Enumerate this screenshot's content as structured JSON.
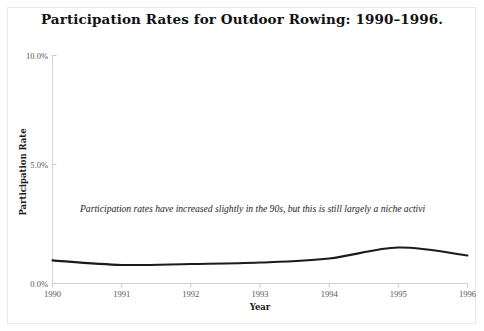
{
  "chart_data": {
    "type": "line",
    "title": "Participation Rates for Outdoor Rowing: 1990–1996.",
    "xlabel": "Year",
    "ylabel": "Participation Rate",
    "categories": [
      1990,
      1991,
      1992,
      1993,
      1994,
      1995,
      1996
    ],
    "x": [
      1990,
      1991,
      1992,
      1993,
      1994,
      1995,
      1996
    ],
    "values": [
      0.97,
      0.78,
      0.82,
      0.88,
      1.05,
      1.51,
      1.18
    ],
    "series": [
      {
        "name": "Participation Rate",
        "values": [
          0.97,
          0.78,
          0.82,
          0.88,
          1.05,
          1.51,
          1.18
        ]
      }
    ],
    "xlim": [
      1990,
      1996
    ],
    "ylim": [
      0.0,
      10.0
    ],
    "ytick_values": [
      0.0,
      5.0,
      10.0
    ],
    "ytick_labels": [
      "0.0%",
      "5.0%",
      "10.0%"
    ],
    "xtick_labels": [
      "1990",
      "1991",
      "1992",
      "1993",
      "1994",
      "1995",
      "1996"
    ],
    "grid": false,
    "legend": "none",
    "line_color": "#1b1b1b",
    "annotations": [
      {
        "text": "Participation rates have increased slightly in the 90s, but this is still largely a niche activi",
        "style": "italic",
        "clipped": true
      }
    ]
  },
  "figure": {
    "background_color": "#ffffff",
    "border_color": "#e8e8e8",
    "axis_color": "#d2d2d2"
  }
}
